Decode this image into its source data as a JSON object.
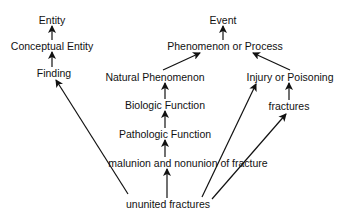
{
  "diagram": {
    "type": "concept hierarchy",
    "nodes": [
      {
        "id": "entity",
        "label": "Entity",
        "x": 52,
        "y": 20
      },
      {
        "id": "conceptual_entity",
        "label": "Conceptual Entity",
        "x": 52,
        "y": 46
      },
      {
        "id": "finding",
        "label": "Finding",
        "x": 54,
        "y": 73
      },
      {
        "id": "event",
        "label": "Event",
        "x": 223,
        "y": 20
      },
      {
        "id": "phenomenon_or_process",
        "label": "Phenomenon or Process",
        "x": 225,
        "y": 46
      },
      {
        "id": "natural_phenomenon",
        "label": "Natural Phenomenon",
        "x": 155,
        "y": 77
      },
      {
        "id": "injury_or_poisoning",
        "label": "Injury or Poisoning",
        "x": 290,
        "y": 77
      },
      {
        "id": "biologic_function",
        "label": "Biologic Function",
        "x": 165,
        "y": 105
      },
      {
        "id": "fractures",
        "label": "fractures",
        "x": 289,
        "y": 106
      },
      {
        "id": "pathologic_function",
        "label": "Pathologic Function",
        "x": 165,
        "y": 134
      },
      {
        "id": "malunion",
        "label": "malunion and nonunion of fracture",
        "x": 188,
        "y": 163
      },
      {
        "id": "ununited_fractures",
        "label": "ununited fractures",
        "x": 168,
        "y": 204
      }
    ],
    "edges": [
      {
        "from": "conceptual_entity",
        "to": "entity",
        "x1": 52,
        "y1": 40,
        "x2": 52,
        "y2": 26
      },
      {
        "from": "finding",
        "to": "conceptual_entity",
        "x1": 52,
        "y1": 67,
        "x2": 52,
        "y2": 52
      },
      {
        "from": "phenomenon_or_process",
        "to": "event",
        "x1": 223,
        "y1": 40,
        "x2": 223,
        "y2": 26
      },
      {
        "from": "natural_phenomenon",
        "to": "phenomenon_or_process",
        "x1": 163,
        "y1": 70,
        "x2": 200,
        "y2": 53
      },
      {
        "from": "injury_or_poisoning",
        "to": "phenomenon_or_process",
        "x1": 290,
        "y1": 70,
        "x2": 253,
        "y2": 53
      },
      {
        "from": "biologic_function",
        "to": "natural_phenomenon",
        "x1": 165,
        "y1": 99,
        "x2": 165,
        "y2": 83
      },
      {
        "from": "fractures",
        "to": "injury_or_poisoning",
        "x1": 289,
        "y1": 100,
        "x2": 289,
        "y2": 83
      },
      {
        "from": "pathologic_function",
        "to": "biologic_function",
        "x1": 165,
        "y1": 128,
        "x2": 165,
        "y2": 111
      },
      {
        "from": "malunion",
        "to": "pathologic_function",
        "x1": 165,
        "y1": 157,
        "x2": 165,
        "y2": 140
      },
      {
        "from": "ununited_fractures",
        "to": "malunion",
        "x1": 167,
        "y1": 198,
        "x2": 167,
        "y2": 169
      },
      {
        "from": "ununited_fractures",
        "to": "finding",
        "x1": 128,
        "y1": 194,
        "x2": 56,
        "y2": 80
      },
      {
        "from": "ununited_fractures",
        "to": "injury_or_poisoning",
        "x1": 202,
        "y1": 197,
        "x2": 256,
        "y2": 84
      },
      {
        "from": "ununited_fractures",
        "to": "fractures",
        "x1": 212,
        "y1": 199,
        "x2": 286,
        "y2": 114
      }
    ],
    "colors": {
      "background": "#ffffff",
      "ink": "#111111"
    }
  }
}
